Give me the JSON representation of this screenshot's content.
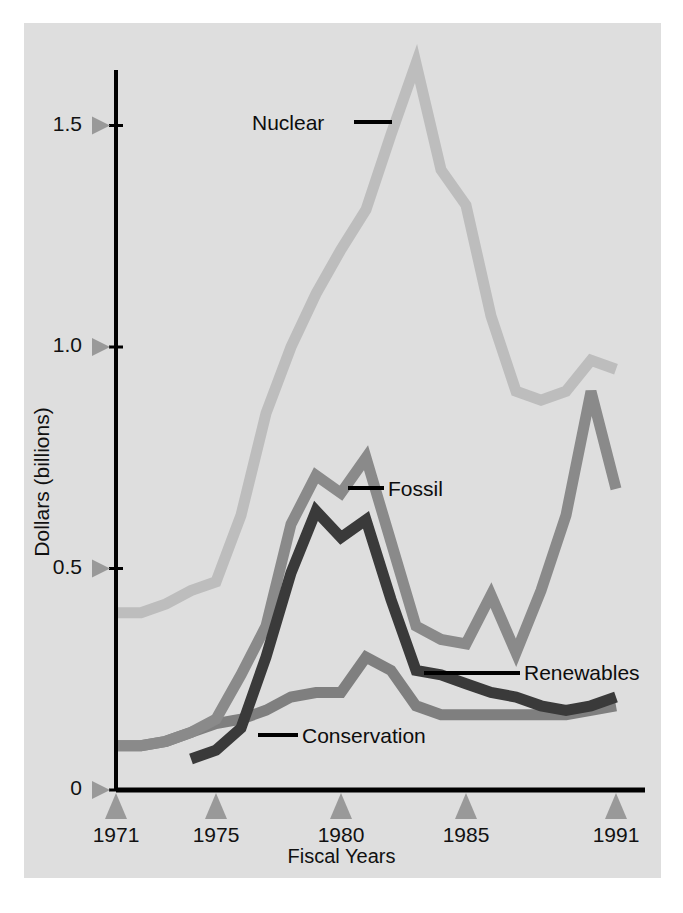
{
  "chart_data": {
    "type": "line",
    "title": "",
    "xlabel": "Fiscal Years",
    "ylabel": "Dollars (billions)",
    "xlim": [
      1971,
      1991
    ],
    "ylim": [
      0,
      1.75
    ],
    "grid": false,
    "legend_position": "inline-annotations",
    "x_tick_labels": [
      "1971",
      "1975",
      "1980",
      "1985",
      "1991"
    ],
    "x_tick_values": [
      1971,
      1975,
      1980,
      1985,
      1991
    ],
    "y_tick_labels": [
      "0",
      "0.5",
      "1.0",
      "1.5"
    ],
    "y_tick_values": [
      0,
      0.5,
      1.0,
      1.5
    ],
    "x": [
      1971,
      1972,
      1973,
      1974,
      1975,
      1976,
      1977,
      1978,
      1979,
      1980,
      1981,
      1982,
      1983,
      1984,
      1985,
      1986,
      1987,
      1988,
      1989,
      1990,
      1991
    ],
    "series": [
      {
        "name": "Nuclear",
        "color": "#bdbdbd",
        "values": [
          0.4,
          0.4,
          0.42,
          0.45,
          0.47,
          0.62,
          0.85,
          1.0,
          1.12,
          1.22,
          1.31,
          1.48,
          1.64,
          1.4,
          1.32,
          1.07,
          0.9,
          0.88,
          0.9,
          0.97,
          0.95
        ]
      },
      {
        "name": "Renewables",
        "color": "#8a8a8a",
        "values": [
          0.1,
          0.1,
          0.11,
          0.13,
          0.16,
          0.26,
          0.37,
          0.6,
          0.71,
          0.67,
          0.75,
          0.56,
          0.37,
          0.34,
          0.33,
          0.44,
          0.31,
          0.45,
          0.62,
          0.9,
          0.68
        ]
      },
      {
        "name": "Conservation",
        "color": "#3a3a3a",
        "values": [
          null,
          null,
          null,
          0.07,
          0.09,
          0.14,
          0.3,
          0.49,
          0.63,
          0.57,
          0.61,
          0.43,
          0.27,
          0.26,
          0.24,
          0.22,
          0.21,
          0.19,
          0.18,
          0.19,
          0.21
        ]
      },
      {
        "name": "Fossil",
        "color": "#7f7f7f",
        "values": [
          0.1,
          0.1,
          0.11,
          0.13,
          0.15,
          0.16,
          0.18,
          0.21,
          0.22,
          0.22,
          0.3,
          0.27,
          0.19,
          0.17,
          0.17,
          0.17,
          0.17,
          0.17,
          0.17,
          0.18,
          0.19
        ]
      }
    ],
    "annotations": [
      {
        "label": "Nuclear",
        "text_x": 252,
        "text_y": 111,
        "leader_x1": 354,
        "leader_y1": 122,
        "leader_x2": 392,
        "leader_y2": 122
      },
      {
        "label": "Fossil",
        "text_x": 388,
        "text_y": 477,
        "leader_x1": 348,
        "leader_y1": 488,
        "leader_x2": 384,
        "leader_y2": 488
      },
      {
        "label": "Renewables",
        "text_x": 524,
        "text_y": 661,
        "leader_x1": 424,
        "leader_y1": 673,
        "leader_x2": 520,
        "leader_y2": 673
      },
      {
        "label": "Conservation",
        "text_x": 302,
        "text_y": 724,
        "leader_x1": 258,
        "leader_y1": 735,
        "leader_x2": 298,
        "leader_y2": 735
      }
    ],
    "axis_color": "#000000",
    "tick_marker_color": "#999999",
    "plot_background": "#dedede"
  }
}
